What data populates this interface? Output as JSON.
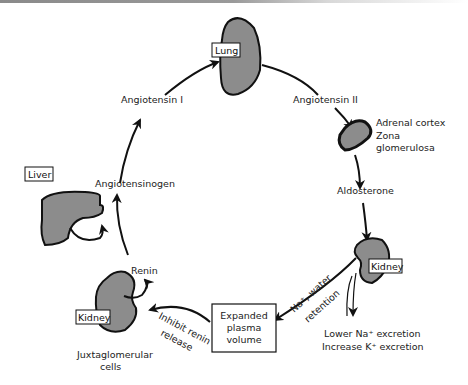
{
  "diagram": {
    "organs": {
      "lung": "Lung",
      "liver": "Liver",
      "kidney_right": "Kidney",
      "kidney_left": "Kidney"
    },
    "labels": {
      "angiotensin_1": "Angiotensin I",
      "angiotensin_2": "Angiotensin II",
      "adrenal_1": "Adrenal cortex",
      "adrenal_2": "Zona",
      "adrenal_3": "glomerulosa",
      "aldosterone": "Aldosterone",
      "angiotensinogen": "Angiotensinogen",
      "renin": "Renin",
      "juxta_1": "Juxtaglomerular",
      "juxta_2": "cells",
      "expanded_1": "Expanded",
      "expanded_2": "plasma",
      "expanded_3": "volume",
      "na_water": "Na⁺, water",
      "retention": "retention",
      "inhibit": "Inhibit renin",
      "release": "release",
      "excretion_1": "Lower Na⁺ excretion",
      "excretion_2": "Increase K⁺ excretion"
    },
    "colors": {
      "organ_fill": "#8c8c8c",
      "stroke": "#111111",
      "background": "#ffffff"
    }
  }
}
